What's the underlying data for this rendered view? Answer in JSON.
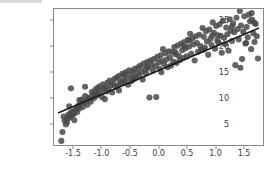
{
  "figure": {
    "background_color": "#ffffff",
    "frame_color": "#8a8a8a",
    "tick_label_color": "#3a3a3a"
  },
  "chart_data": {
    "type": "scatter",
    "title": "",
    "xlabel": "",
    "ylabel": "",
    "xlim": [
      -1.85,
      1.85
    ],
    "ylim": [
      0.8,
      27.2
    ],
    "grid": false,
    "legend": null,
    "point_color": "#4a4a4a",
    "point_size": 3.1,
    "point_opacity": 0.85,
    "xticks": [
      -1.5,
      -1.0,
      -0.5,
      0.0,
      0.5,
      1.0,
      1.5
    ],
    "xtick_labels": [
      "-1.5",
      "-1.0",
      "-0.5",
      "0.0",
      "0.5",
      "1.0",
      "1.5"
    ],
    "yticks": [
      5,
      10,
      15,
      20,
      25
    ],
    "ytick_labels": [
      "5",
      "10",
      "15",
      "20",
      "25"
    ],
    "fit_line": {
      "color": "#1a1a1a",
      "width": 1.6,
      "x_start": -1.78,
      "y_start": 7.0,
      "x_end": 1.78,
      "y_end": 23.5,
      "slope": 4.635,
      "intercept": 15.25
    },
    "x": [
      -1.72,
      -1.7,
      -1.68,
      -1.66,
      -1.64,
      -1.62,
      -1.6,
      -1.58,
      -1.56,
      -1.55,
      -1.54,
      -1.52,
      -1.5,
      -1.49,
      -1.47,
      -1.45,
      -1.44,
      -1.42,
      -1.4,
      -1.38,
      -1.36,
      -1.34,
      -1.32,
      -1.3,
      -1.28,
      -1.26,
      -1.24,
      -1.22,
      -1.2,
      -1.18,
      -1.16,
      -1.14,
      -1.12,
      -1.1,
      -1.08,
      -1.06,
      -1.04,
      -1.02,
      -1.0,
      -0.98,
      -0.96,
      -0.94,
      -0.92,
      -0.9,
      -0.88,
      -0.86,
      -0.84,
      -0.82,
      -0.8,
      -0.78,
      -0.76,
      -0.74,
      -0.72,
      -0.7,
      -0.68,
      -0.66,
      -0.64,
      -0.62,
      -0.6,
      -0.58,
      -0.56,
      -0.54,
      -0.52,
      -0.5,
      -0.48,
      -0.46,
      -0.44,
      -0.42,
      -0.4,
      -0.38,
      -0.36,
      -0.34,
      -0.32,
      -0.3,
      -0.28,
      -0.26,
      -0.24,
      -0.22,
      -0.2,
      -0.18,
      -0.16,
      -0.14,
      -0.12,
      -0.1,
      -0.08,
      -0.06,
      -0.04,
      -0.02,
      0.0,
      0.02,
      0.04,
      0.06,
      0.08,
      0.1,
      0.12,
      0.14,
      0.16,
      0.18,
      0.2,
      0.22,
      0.24,
      0.26,
      0.28,
      0.3,
      0.32,
      0.34,
      0.36,
      0.38,
      0.4,
      0.42,
      0.44,
      0.46,
      0.48,
      0.5,
      0.52,
      0.54,
      0.56,
      0.58,
      0.6,
      0.62,
      0.64,
      0.66,
      0.68,
      0.7,
      0.72,
      0.74,
      0.76,
      0.78,
      0.8,
      0.82,
      0.84,
      0.86,
      0.88,
      0.9,
      0.92,
      0.94,
      0.96,
      0.98,
      1.0,
      1.02,
      1.04,
      1.06,
      1.08,
      1.1,
      1.12,
      1.14,
      1.16,
      1.18,
      1.2,
      1.22,
      1.24,
      1.26,
      1.28,
      1.3,
      1.32,
      1.34,
      1.36,
      1.38,
      1.4,
      1.42,
      1.44,
      1.46,
      1.48,
      1.5,
      1.52,
      1.54,
      1.56,
      1.58,
      1.6,
      1.62,
      1.64,
      1.66,
      1.68,
      1.7,
      1.72,
      1.74,
      1.76,
      -1.62,
      -1.58,
      -1.5,
      -1.3,
      -1.1,
      -0.95,
      -0.7,
      -0.45,
      -0.2,
      0.05,
      0.3,
      0.55,
      0.8,
      1.05,
      1.3,
      1.55,
      1.7,
      -1.4,
      -0.6,
      0.45,
      0.95,
      1.45,
      1.65
    ],
    "y": [
      1.6,
      3.3,
      6.3,
      5.5,
      4.8,
      5.9,
      6.6,
      6.1,
      7.0,
      11.8,
      6.4,
      7.3,
      6.8,
      5.6,
      7.6,
      8.0,
      7.2,
      8.4,
      7.9,
      8.8,
      9.6,
      8.2,
      9.1,
      10.3,
      9.4,
      8.6,
      10.0,
      9.8,
      9.2,
      11.1,
      10.6,
      9.9,
      11.5,
      10.4,
      11.9,
      10.8,
      12.2,
      11.3,
      10.1,
      12.6,
      11.7,
      12.0,
      11.2,
      12.9,
      11.6,
      13.3,
      12.4,
      11.0,
      12.7,
      13.6,
      12.1,
      13.9,
      12.3,
      14.2,
      13.1,
      12.8,
      14.6,
      13.4,
      13.0,
      14.9,
      13.7,
      12.5,
      15.3,
      14.4,
      13.2,
      15.1,
      14.0,
      15.6,
      13.8,
      14.8,
      15.9,
      14.3,
      16.2,
      15.0,
      13.5,
      16.6,
      15.4,
      14.7,
      16.9,
      15.8,
      10.0,
      17.2,
      16.4,
      15.2,
      17.5,
      16.1,
      10.1,
      17.9,
      16.8,
      15.6,
      18.2,
      17.1,
      19.4,
      16.5,
      18.6,
      17.4,
      15.9,
      19.0,
      17.8,
      16.2,
      18.9,
      17.0,
      19.8,
      18.4,
      16.7,
      20.1,
      18.1,
      17.3,
      20.5,
      19.2,
      17.7,
      20.8,
      19.6,
      18.0,
      21.2,
      19.9,
      22.4,
      18.5,
      21.5,
      20.3,
      17.2,
      21.9,
      20.6,
      18.9,
      22.2,
      20.0,
      19.3,
      23.5,
      21.8,
      19.7,
      22.9,
      20.9,
      18.3,
      23.2,
      21.4,
      20.2,
      24.6,
      22.6,
      19.5,
      23.9,
      21.1,
      20.7,
      24.2,
      22.0,
      18.7,
      24.9,
      21.6,
      20.4,
      23.6,
      22.3,
      19.1,
      25.2,
      23.0,
      21.0,
      24.4,
      22.7,
      16.3,
      25.5,
      23.3,
      21.3,
      26.8,
      24.0,
      17.5,
      22.8,
      25.8,
      20.5,
      23.7,
      21.7,
      26.1,
      24.8,
      19.4,
      25.1,
      22.5,
      20.8,
      24.3,
      21.9,
      17.6,
      5.2,
      8.3,
      6.9,
      12.1,
      10.9,
      9.7,
      11.4,
      13.5,
      16.0,
      14.9,
      18.8,
      21.1,
      19.3,
      22.1,
      23.8,
      20.6,
      24.5,
      9.5,
      14.5,
      19.9,
      22.0,
      15.8,
      26.4
    ]
  }
}
